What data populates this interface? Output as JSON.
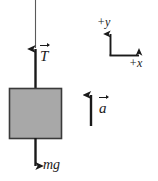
{
  "diagram": {
    "background_color": "#ffffff",
    "stroke_color": "#1a1a1a",
    "block": {
      "name": "block",
      "fill_color": "#a8a8a8",
      "border_color": "#3a3a3a",
      "x": 9,
      "y": 88,
      "width": 53,
      "height": 51
    },
    "rope": {
      "name": "rope",
      "x": 35,
      "y_top": 0,
      "y_bottom": 47
    },
    "vectors": [
      {
        "id": "tension",
        "label": "T",
        "has_vector_arrow": true,
        "direction": "up",
        "x": 35,
        "y_tail": 88,
        "y_head": 47
      },
      {
        "id": "weight",
        "label": "mg",
        "has_vector_arrow": false,
        "direction": "down",
        "x": 35,
        "y_tail": 139,
        "y_head": 167
      },
      {
        "id": "acceleration",
        "label": "a",
        "has_vector_arrow": true,
        "direction": "up",
        "x": 91,
        "y_tail": 126,
        "y_head": 93
      }
    ],
    "axes": {
      "origin_x": 110,
      "origin_y": 55,
      "y_axis_label": "+y",
      "x_axis_label": "+x",
      "y_axis_tip_y": 32,
      "x_axis_tip_x": 141
    }
  }
}
